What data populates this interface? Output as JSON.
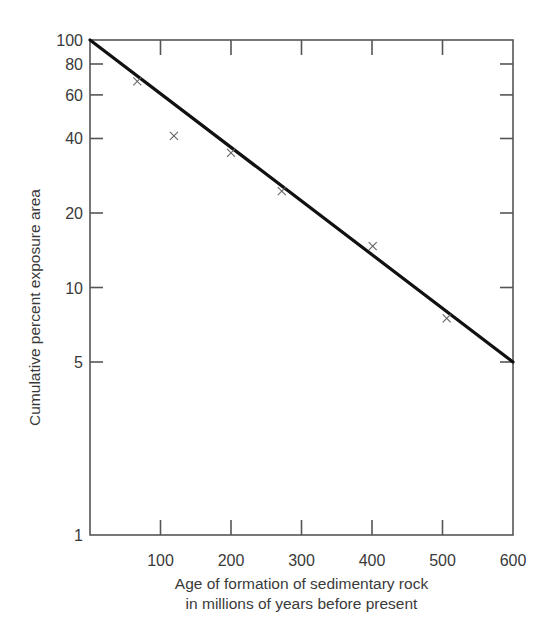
{
  "chart_data": {
    "type": "scatter",
    "title": "",
    "xlabel": "Age of formation of sedimentary rock\nin millions of years before present",
    "xlabel_lines": [
      "Age of formation of sedimentary rock",
      "in millions of years before present"
    ],
    "ylabel": "Cumulative percent exposure area",
    "xlim": [
      0,
      600
    ],
    "ylim": [
      1,
      100
    ],
    "yscale": "log",
    "grid": false,
    "legend": null,
    "x_ticks": [
      100,
      200,
      300,
      400,
      500,
      600
    ],
    "x_tick_labels": [
      "100",
      "200",
      "300",
      "400",
      "500",
      "600"
    ],
    "y_ticks": [
      1,
      5,
      10,
      20,
      40,
      60,
      80,
      100
    ],
    "y_tick_labels": [
      "1",
      "5",
      "10",
      "20",
      "40",
      "60",
      "80",
      "100"
    ],
    "series": [
      {
        "name": "Observed",
        "type": "scatter",
        "marker": "x",
        "x": [
          67,
          119,
          200,
          272,
          401,
          506
        ],
        "y": [
          68,
          41,
          35,
          24.5,
          14.7,
          7.5
        ]
      },
      {
        "name": "Fitted line",
        "type": "line",
        "x": [
          0,
          600
        ],
        "y": [
          100,
          5
        ]
      }
    ]
  }
}
